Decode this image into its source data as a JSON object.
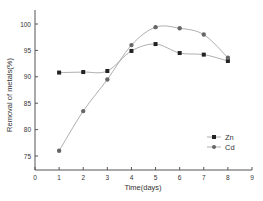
{
  "chart_data": {
    "type": "line",
    "title": "",
    "xlabel": "Time(days)",
    "ylabel": "Removal of metals(%)",
    "xlim": [
      0,
      9
    ],
    "ylim": [
      72.5,
      102.5
    ],
    "xticks": [
      0,
      1,
      2,
      3,
      4,
      5,
      6,
      7,
      8,
      9
    ],
    "yticks": [
      75,
      80,
      85,
      90,
      95,
      100
    ],
    "grid": false,
    "legend_position": "lower right",
    "series": [
      {
        "name": "Zn",
        "marker": "square",
        "color": "#222222",
        "x": [
          1,
          2,
          3,
          4,
          5,
          6,
          7,
          8
        ],
        "values": [
          90.8,
          90.9,
          91.1,
          94.9,
          96.2,
          94.5,
          94.2,
          93.0
        ]
      },
      {
        "name": "Cd",
        "marker": "circle",
        "color": "#666666",
        "x": [
          1,
          2,
          3,
          4,
          5,
          6,
          7,
          8
        ],
        "values": [
          76.0,
          83.5,
          89.5,
          96.0,
          99.4,
          99.2,
          98.0,
          93.6
        ]
      }
    ]
  }
}
